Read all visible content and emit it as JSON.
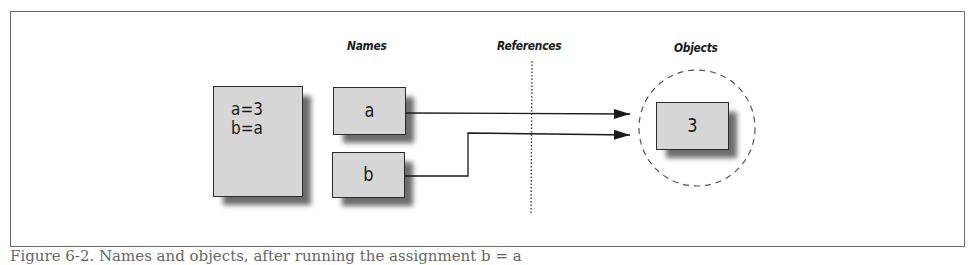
{
  "figure": {
    "column_labels": {
      "names": "Names",
      "references": "References",
      "objects": "Objects"
    },
    "code_box": {
      "lines": [
        "a=3",
        "b=a"
      ]
    },
    "name_boxes": [
      {
        "label": "a"
      },
      {
        "label": "b"
      }
    ],
    "object_boxes": [
      {
        "value": "3"
      }
    ],
    "references": [
      {
        "from": "a",
        "to": "3"
      },
      {
        "from": "b",
        "to": "3"
      }
    ],
    "caption": "Figure 6-2. Names and objects, after running the assignment b = a",
    "colors": {
      "box_fill": "#d6d6d6",
      "box_border": "#2b2b2b",
      "line": "#1a1a1a",
      "frame": "#6a6a6a"
    }
  }
}
